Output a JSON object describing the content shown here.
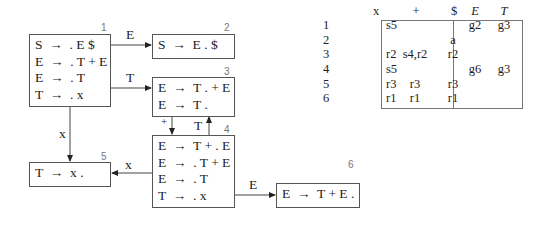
{
  "states": [
    {
      "id": "1",
      "items": [
        "S  →  . E $",
        "E  →  . T + E",
        "E  →  . T",
        "T  →  . x"
      ]
    },
    {
      "id": "2",
      "items": [
        "S  →  E . $"
      ]
    },
    {
      "id": "3",
      "items": [
        "E  →  T . + E",
        "E  →  T ."
      ]
    },
    {
      "id": "4",
      "items": [
        "E  →  T + . E",
        "E  →  . T + E",
        "E  →  . T",
        "T  →  . x"
      ]
    },
    {
      "id": "5",
      "items": [
        "T  →  x ."
      ]
    },
    {
      "id": "6",
      "items": [
        "E  →  T + E ."
      ]
    }
  ],
  "edges": [
    {
      "from": "1",
      "to": "2",
      "label": "E"
    },
    {
      "from": "1",
      "to": "3",
      "label": "T"
    },
    {
      "from": "1",
      "to": "5",
      "label": "x"
    },
    {
      "from": "3",
      "to": "4",
      "label": "+"
    },
    {
      "from": "4",
      "to": "3",
      "label": "T"
    },
    {
      "from": "4",
      "to": "5",
      "label": "x"
    },
    {
      "from": "4",
      "to": "6",
      "label": "E"
    }
  ],
  "table": {
    "headers": [
      "x",
      "+",
      "$",
      "E",
      "T"
    ],
    "rows": [
      {
        "state": "1",
        "cells": [
          "s5",
          "",
          "",
          "g2",
          "g3"
        ]
      },
      {
        "state": "2",
        "cells": [
          "",
          "",
          "a",
          "",
          ""
        ]
      },
      {
        "state": "3",
        "cells": [
          "r2",
          "s4,r2",
          "r2",
          "",
          ""
        ]
      },
      {
        "state": "4",
        "cells": [
          "s5",
          "",
          "",
          "g6",
          "g3"
        ]
      },
      {
        "state": "5",
        "cells": [
          "r3",
          "r3",
          "r3",
          "",
          ""
        ]
      },
      {
        "state": "6",
        "cells": [
          "r1",
          "r1",
          "r1",
          "",
          ""
        ]
      }
    ]
  }
}
